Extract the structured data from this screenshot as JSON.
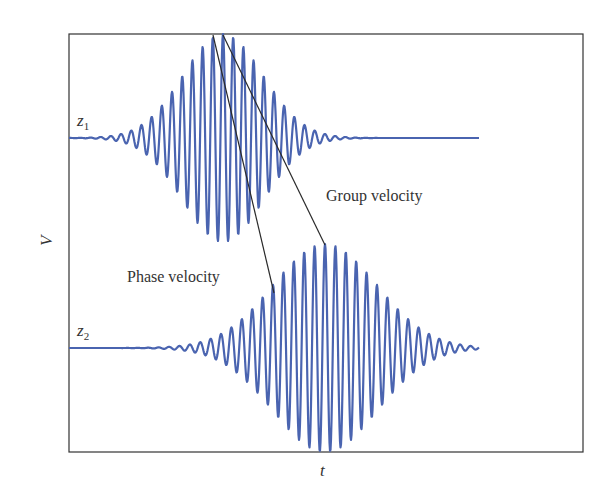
{
  "diagram": {
    "frame": {
      "x": 69,
      "y": 34,
      "width": 514,
      "height": 418,
      "stroke": "#333333"
    },
    "axes": {
      "xlabel": "t",
      "ylabel": "V"
    },
    "wave_color": "#4a64b0",
    "line_color": "#2a2a2a",
    "traces": [
      {
        "id": "z1",
        "label_main": "z",
        "label_sub": "1",
        "baseline_y": 138,
        "x_start": 69,
        "x_end": 479,
        "center_x": 223,
        "sigma": 40,
        "amplitude": 104,
        "period": 10.2
      },
      {
        "id": "z2",
        "label_main": "z",
        "label_sub": "2",
        "baseline_y": 348,
        "x_start": 69,
        "x_end": 479,
        "center_x": 325,
        "sigma": 52,
        "amplitude": 104,
        "period": 10.4
      }
    ],
    "annotations": {
      "phase_velocity": {
        "text": "Phase velocity",
        "line": {
          "x1": 213,
          "y1": 35,
          "x2": 274,
          "y2": 293
        }
      },
      "group_velocity": {
        "text": "Group velocity",
        "line": {
          "x1": 223,
          "y1": 35,
          "x2": 325,
          "y2": 245
        }
      }
    }
  }
}
